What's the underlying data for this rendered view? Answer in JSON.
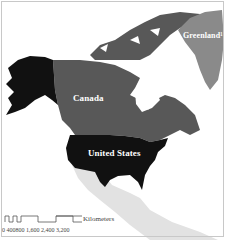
{
  "map": {
    "regions": [
      {
        "name": "Canada",
        "color": "#585858"
      },
      {
        "name": "United States",
        "color": "#111111"
      },
      {
        "name": "Greenland",
        "color": "#8a8a8a"
      },
      {
        "name": "Mexico & Central America",
        "color": "#e2e2e2"
      }
    ],
    "labels": {
      "canada": "Canada",
      "united_states": "United States",
      "greenland": "Greenland¹"
    },
    "scale_bar": {
      "unit": "Kilometers",
      "ticks": [
        "0",
        "400",
        "800",
        "1,600",
        "2,400",
        "3,200"
      ],
      "tick_text": "0  400800    1,600   2,400   3,200"
    }
  }
}
